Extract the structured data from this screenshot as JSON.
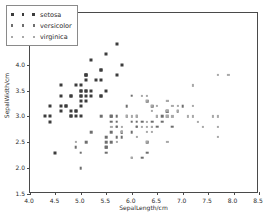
{
  "chart_data": {
    "type": "scatter",
    "title": "",
    "xlabel": "SepalLength/cm",
    "ylabel": "SepalWidth/cm",
    "xlim": [
      4.0,
      8.5
    ],
    "ylim": [
      1.5,
      5.0
    ],
    "xticks": [
      "4.0",
      "4.5",
      "5.0",
      "5.5",
      "6.0",
      "6.5",
      "7.0",
      "7.5",
      "8.0",
      "8.5"
    ],
    "yticks": [
      "1.5",
      "2.0",
      "2.5",
      "3.0",
      "3.5",
      "4.0",
      "4.5",
      "5.0"
    ],
    "xtick_values": [
      4.0,
      4.5,
      5.0,
      5.5,
      6.0,
      6.5,
      7.0,
      7.5,
      8.0,
      8.5
    ],
    "ytick_values": [
      1.5,
      2.0,
      2.5,
      3.0,
      3.5,
      4.0,
      4.5,
      5.0
    ],
    "grid": false,
    "legend_position": "upper left",
    "series": [
      {
        "name": "setosa",
        "color": "#3c3c3c",
        "marker": "square",
        "points": [
          [
            5.1,
            3.5
          ],
          [
            4.9,
            3.0
          ],
          [
            4.7,
            3.2
          ],
          [
            4.6,
            3.1
          ],
          [
            5.0,
            3.6
          ],
          [
            5.4,
            3.9
          ],
          [
            4.6,
            3.4
          ],
          [
            5.0,
            3.4
          ],
          [
            4.4,
            2.9
          ],
          [
            4.9,
            3.1
          ],
          [
            5.4,
            3.7
          ],
          [
            4.8,
            3.4
          ],
          [
            4.8,
            3.0
          ],
          [
            4.3,
            3.0
          ],
          [
            5.8,
            4.0
          ],
          [
            5.7,
            4.4
          ],
          [
            5.4,
            3.9
          ],
          [
            5.1,
            3.5
          ],
          [
            5.7,
            3.8
          ],
          [
            5.1,
            3.8
          ],
          [
            5.4,
            3.4
          ],
          [
            5.1,
            3.7
          ],
          [
            4.6,
            3.6
          ],
          [
            5.1,
            3.3
          ],
          [
            4.8,
            3.4
          ],
          [
            5.0,
            3.0
          ],
          [
            5.0,
            3.4
          ],
          [
            5.2,
            3.5
          ],
          [
            5.2,
            3.4
          ],
          [
            4.7,
            3.2
          ],
          [
            4.8,
            3.1
          ],
          [
            5.4,
            3.4
          ],
          [
            5.2,
            4.1
          ],
          [
            5.5,
            4.2
          ],
          [
            4.9,
            3.1
          ],
          [
            5.0,
            3.2
          ],
          [
            5.5,
            3.5
          ],
          [
            4.9,
            3.6
          ],
          [
            4.4,
            3.0
          ],
          [
            5.1,
            3.4
          ],
          [
            5.0,
            3.5
          ],
          [
            4.5,
            2.3
          ],
          [
            4.4,
            3.2
          ],
          [
            5.0,
            3.5
          ],
          [
            5.1,
            3.8
          ],
          [
            4.8,
            3.0
          ],
          [
            5.1,
            3.8
          ],
          [
            4.6,
            3.2
          ],
          [
            5.3,
            3.7
          ],
          [
            5.0,
            3.3
          ]
        ]
      },
      {
        "name": "versicolor",
        "color": "#6e6e6e",
        "marker": "square",
        "points": [
          [
            7.0,
            3.2
          ],
          [
            6.4,
            3.2
          ],
          [
            6.9,
            3.1
          ],
          [
            5.5,
            2.3
          ],
          [
            6.5,
            2.8
          ],
          [
            5.7,
            2.8
          ],
          [
            6.3,
            3.3
          ],
          [
            4.9,
            2.4
          ],
          [
            6.6,
            2.9
          ],
          [
            5.2,
            2.7
          ],
          [
            5.0,
            2.0
          ],
          [
            5.9,
            3.0
          ],
          [
            6.0,
            2.2
          ],
          [
            6.1,
            2.9
          ],
          [
            5.6,
            2.9
          ],
          [
            6.7,
            3.1
          ],
          [
            5.6,
            3.0
          ],
          [
            5.8,
            2.7
          ],
          [
            6.2,
            2.2
          ],
          [
            5.6,
            2.5
          ],
          [
            5.9,
            3.2
          ],
          [
            6.1,
            2.8
          ],
          [
            6.3,
            2.5
          ],
          [
            6.1,
            2.8
          ],
          [
            6.4,
            2.9
          ],
          [
            6.6,
            3.0
          ],
          [
            6.8,
            2.8
          ],
          [
            6.7,
            3.0
          ],
          [
            6.0,
            2.9
          ],
          [
            5.7,
            2.6
          ],
          [
            5.5,
            2.4
          ],
          [
            5.5,
            2.4
          ],
          [
            5.8,
            2.7
          ],
          [
            6.0,
            2.7
          ],
          [
            5.4,
            3.0
          ],
          [
            6.0,
            3.4
          ],
          [
            6.7,
            3.1
          ],
          [
            6.3,
            2.3
          ],
          [
            5.6,
            3.0
          ],
          [
            5.5,
            2.5
          ],
          [
            5.5,
            2.6
          ],
          [
            6.1,
            3.0
          ],
          [
            5.8,
            2.6
          ],
          [
            5.0,
            2.3
          ],
          [
            5.6,
            2.7
          ],
          [
            5.7,
            3.0
          ],
          [
            5.7,
            2.9
          ],
          [
            6.2,
            2.9
          ],
          [
            5.1,
            2.5
          ],
          [
            5.7,
            2.8
          ]
        ]
      },
      {
        "name": "virginica",
        "color": "#a8a8a8",
        "marker": "square",
        "points": [
          [
            6.3,
            3.3
          ],
          [
            5.8,
            2.7
          ],
          [
            7.1,
            3.0
          ],
          [
            6.3,
            2.9
          ],
          [
            6.5,
            3.0
          ],
          [
            7.6,
            3.0
          ],
          [
            4.9,
            2.5
          ],
          [
            7.3,
            2.9
          ],
          [
            6.7,
            2.5
          ],
          [
            7.2,
            3.6
          ],
          [
            6.5,
            3.2
          ],
          [
            6.4,
            2.7
          ],
          [
            6.8,
            3.0
          ],
          [
            5.7,
            2.5
          ],
          [
            5.8,
            2.8
          ],
          [
            6.4,
            3.2
          ],
          [
            6.5,
            3.0
          ],
          [
            7.7,
            3.8
          ],
          [
            7.7,
            2.6
          ],
          [
            6.0,
            2.2
          ],
          [
            6.9,
            3.2
          ],
          [
            5.6,
            2.8
          ],
          [
            7.7,
            2.8
          ],
          [
            6.3,
            2.7
          ],
          [
            6.7,
            3.3
          ],
          [
            7.2,
            3.2
          ],
          [
            6.2,
            2.8
          ],
          [
            6.1,
            3.0
          ],
          [
            6.4,
            2.8
          ],
          [
            7.2,
            3.0
          ],
          [
            7.4,
            2.8
          ],
          [
            7.9,
            3.8
          ],
          [
            6.4,
            2.8
          ],
          [
            6.3,
            2.8
          ],
          [
            6.1,
            2.6
          ],
          [
            7.7,
            3.0
          ],
          [
            6.3,
            3.4
          ],
          [
            6.4,
            3.1
          ],
          [
            6.0,
            3.0
          ],
          [
            6.9,
            3.1
          ],
          [
            6.7,
            3.1
          ],
          [
            6.9,
            3.1
          ],
          [
            5.8,
            2.7
          ],
          [
            6.8,
            3.2
          ],
          [
            6.7,
            3.3
          ],
          [
            6.7,
            3.0
          ],
          [
            6.3,
            2.5
          ],
          [
            6.5,
            3.0
          ],
          [
            6.2,
            3.4
          ],
          [
            5.9,
            3.0
          ]
        ]
      }
    ]
  },
  "legend": {
    "entries": [
      {
        "label": "setosa"
      },
      {
        "label": "versicolor"
      },
      {
        "label": "virginica"
      }
    ]
  }
}
